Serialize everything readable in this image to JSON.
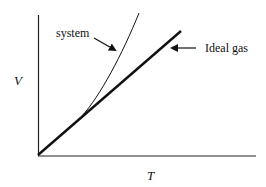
{
  "diagram": {
    "axes": {
      "x_label": "T",
      "y_label": "V"
    },
    "curves": [
      {
        "name": "system",
        "label": "system",
        "style": "thin curve",
        "description": "deviates above ideal line at higher T"
      },
      {
        "name": "ideal-gas",
        "label": "Ideal gas",
        "style": "thick straight line",
        "description": "linear V vs T from origin"
      }
    ],
    "colors": {
      "line": "#111111",
      "background": "#ffffff"
    }
  }
}
